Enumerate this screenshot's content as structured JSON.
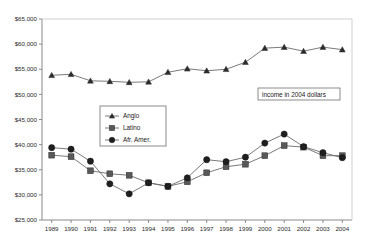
{
  "chart_data": {
    "type": "line",
    "title": "",
    "subtitle": "",
    "xlabel": "",
    "ylabel": "",
    "annotation": "income in 2004 dollars",
    "grid": false,
    "legend_position": "inside-center-left",
    "ylim": [
      25000,
      65000
    ],
    "ytick_step": 5000,
    "ytick_labels": [
      "$25,000",
      "$30,000",
      "$35,000",
      "$40,000",
      "$45,000",
      "$50,000",
      "$55,000",
      "$60,000",
      "$65,000"
    ],
    "ytick_values": [
      25000,
      30000,
      35000,
      40000,
      45000,
      50000,
      55000,
      60000,
      65000
    ],
    "categories": [
      "1989",
      "1990",
      "1991",
      "1992",
      "1993",
      "1994",
      "1995",
      "1996",
      "1997",
      "1998",
      "1999",
      "2000",
      "2001",
      "2002",
      "2003",
      "2004"
    ],
    "x": [
      1989,
      1990,
      1991,
      1992,
      1993,
      1994,
      1995,
      1996,
      1997,
      1998,
      1999,
      2000,
      2001,
      2002,
      2003,
      2004
    ],
    "series": [
      {
        "name": "Anglo",
        "marker": "triangle",
        "color": "#2b2b2b",
        "values": [
          53800,
          54000,
          52700,
          52600,
          52400,
          52500,
          54400,
          55100,
          54700,
          55000,
          56400,
          59200,
          59400,
          58600,
          59400,
          58900
        ]
      },
      {
        "name": "Latino",
        "marker": "square",
        "color": "#595959",
        "values": [
          37900,
          37600,
          34800,
          34200,
          33900,
          32400,
          31700,
          32600,
          34400,
          35600,
          36100,
          37800,
          39800,
          39500,
          37800,
          37800
        ]
      },
      {
        "name": "Afr. Amer.",
        "marker": "circle",
        "color": "#1f1f1f",
        "values": [
          39400,
          39100,
          36700,
          32200,
          30200,
          32400,
          31700,
          33400,
          37000,
          36600,
          37500,
          40300,
          42100,
          39600,
          38400,
          37400
        ]
      }
    ]
  },
  "legend": {
    "items": [
      {
        "label": "Anglo",
        "marker": "triangle"
      },
      {
        "label": "Latino",
        "marker": "square"
      },
      {
        "label": "Afr. Amer.",
        "marker": "circle"
      }
    ]
  },
  "annotation_box": {
    "text": "income in 2004 dollars"
  }
}
